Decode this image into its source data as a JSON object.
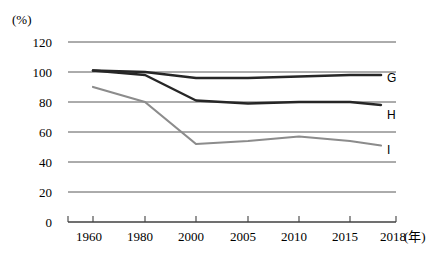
{
  "chart_data": {
    "type": "line",
    "title": "",
    "subtitle": "",
    "xlabel": "年",
    "ylabel": "%",
    "y_unit_label": "(%)",
    "x_unit_label": "(年)",
    "categories": [
      "1960",
      "1980",
      "2000",
      "2005",
      "2010",
      "2015",
      "2018"
    ],
    "x": [
      1960,
      1980,
      2000,
      2005,
      2010,
      2015,
      2018
    ],
    "ylim": [
      0,
      120
    ],
    "yticks": [
      0,
      20,
      40,
      60,
      80,
      100,
      120
    ],
    "ytick_labels": [
      "0",
      "20",
      "40",
      "60",
      "80",
      "100",
      "120"
    ],
    "grid": true,
    "grid_axis": "y",
    "legend_position": "right-inline-end-of-line",
    "series": [
      {
        "name": "G",
        "label": "G",
        "color": "#262626",
        "width": 2.6,
        "values": [
          101,
          100,
          96,
          96,
          97,
          98,
          98
        ]
      },
      {
        "name": "H",
        "label": "H",
        "color": "#262626",
        "width": 2.4,
        "values": [
          101,
          98,
          81,
          79,
          80,
          80,
          78
        ]
      },
      {
        "name": "I",
        "label": "I",
        "color": "#8c8c8c",
        "width": 2.2,
        "values": [
          90,
          80,
          52,
          54,
          57,
          54,
          51
        ]
      }
    ]
  },
  "axes": {
    "y_axis_unit": "(%)",
    "x_axis_unit": "(年)",
    "y_labels": [
      "120",
      "100",
      "80",
      "60",
      "40",
      "20",
      "0"
    ],
    "x_labels": [
      "1960",
      "1980",
      "2000",
      "2005",
      "2010",
      "2015",
      "2018"
    ]
  },
  "legend": {
    "items": [
      {
        "label": "G"
      },
      {
        "label": "H"
      },
      {
        "label": "I"
      }
    ]
  },
  "colors": {
    "grid": "#595959",
    "axis": "#404040",
    "dark_series": "#262626",
    "light_series": "#8c8c8c",
    "background": "#ffffff",
    "text": "#1a1a1a"
  }
}
